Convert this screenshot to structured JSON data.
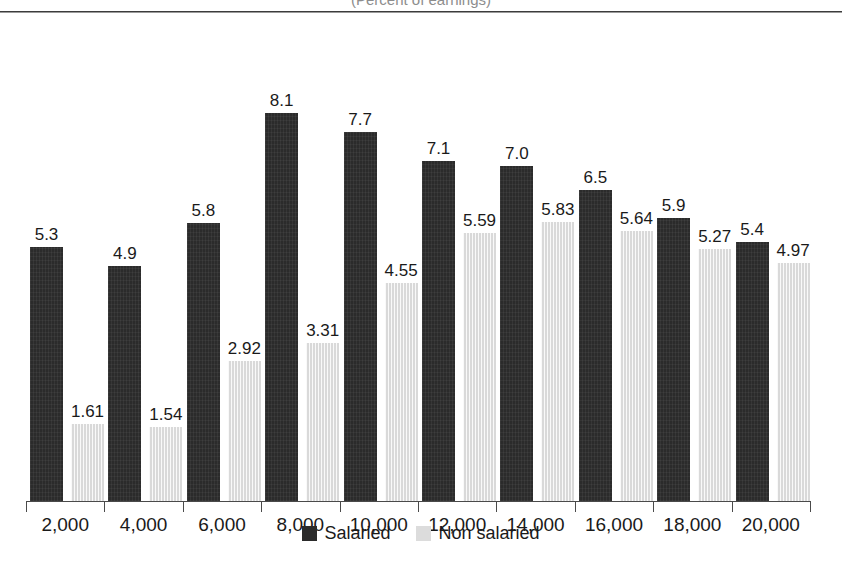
{
  "figure": {
    "title_clipped": "(Percent of earnings)",
    "legend_position": "bottom-center"
  },
  "legend": [
    {
      "label": "Salaried",
      "color": "#2b2b2b",
      "swatch": "legend-swatch-salaried"
    },
    {
      "label": "Non salaried",
      "color": "#dcdcdc",
      "swatch": "legend-swatch-non-salaried"
    }
  ],
  "chart_data": {
    "type": "bar",
    "title": "(Percent of earnings)",
    "xlabel": "",
    "ylabel": "",
    "ylim": [
      0,
      9
    ],
    "grid": false,
    "legend_position": "bottom-center",
    "categories": [
      "2,000",
      "4,000",
      "6,000",
      "8,000",
      "10,000",
      "12,000",
      "14,000",
      "16,000",
      "18,000",
      "20,000"
    ],
    "series": [
      {
        "name": "Salaried",
        "color": "#2b2b2b",
        "values": [
          5.3,
          4.9,
          5.8,
          8.1,
          7.7,
          7.1,
          7.0,
          6.5,
          5.9,
          5.4
        ],
        "labels": [
          "5.3",
          "4.9",
          "5.8",
          "8.1",
          "7.7",
          "7.1",
          "7.0",
          "6.5",
          "5.9",
          "5.4"
        ]
      },
      {
        "name": "Non salaried",
        "color": "#d9d9d9",
        "values": [
          1.61,
          1.54,
          2.92,
          3.31,
          4.55,
          5.59,
          5.83,
          5.64,
          5.27,
          4.97
        ],
        "labels": [
          "1.61",
          "1.54",
          "2.92",
          "3.31",
          "4.55",
          "5.59",
          "5.83",
          "5.64",
          "5.27",
          "4.97"
        ]
      }
    ]
  }
}
